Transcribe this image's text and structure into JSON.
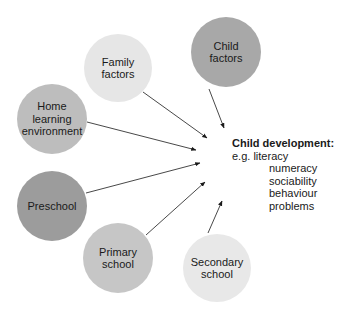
{
  "diagram": {
    "nodes": [
      {
        "id": "family-factors",
        "label": "Family\nfactors",
        "color": "#e6e6e6",
        "cx": 118,
        "cy": 68,
        "r": 34
      },
      {
        "id": "child-factors",
        "label": "Child\nfactors",
        "color": "#a8a8a8",
        "cx": 226,
        "cy": 52,
        "r": 35
      },
      {
        "id": "home-learning-environment",
        "label": "Home\nlearning\nenvironment",
        "color": "#bdbdbd",
        "cx": 52,
        "cy": 119,
        "r": 35
      },
      {
        "id": "preschool",
        "label": "Preschool",
        "color": "#9c9c9c",
        "cx": 52,
        "cy": 206,
        "r": 35
      },
      {
        "id": "primary-school",
        "label": "Primary\nschool",
        "color": "#c6c6c6",
        "cx": 118,
        "cy": 258,
        "r": 35
      },
      {
        "id": "secondary-school",
        "label": "Secondary\nschool",
        "color": "#e8e8e8",
        "cx": 217,
        "cy": 268,
        "r": 34
      }
    ],
    "outcome": {
      "title": "Child development:",
      "prefix": "e.g. literacy",
      "items": [
        "numeracy",
        "sociability",
        "behaviour problems"
      ]
    },
    "arrows": [
      {
        "from": "family-factors",
        "x1": 143,
        "y1": 92,
        "x2": 207,
        "y2": 138
      },
      {
        "from": "child-factors",
        "x1": 209,
        "y1": 89,
        "x2": 224,
        "y2": 128
      },
      {
        "from": "home-learning-environment",
        "x1": 87,
        "y1": 122,
        "x2": 196,
        "y2": 150
      },
      {
        "from": "preschool",
        "x1": 86,
        "y1": 193,
        "x2": 200,
        "y2": 163
      },
      {
        "from": "primary-school",
        "x1": 146,
        "y1": 235,
        "x2": 205,
        "y2": 182
      },
      {
        "from": "secondary-school",
        "x1": 208,
        "y1": 233,
        "x2": 222,
        "y2": 201
      }
    ],
    "line_color": "#333333"
  }
}
